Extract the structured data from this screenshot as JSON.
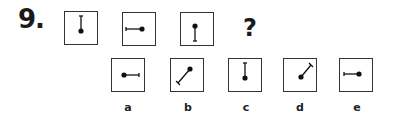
{
  "question": {
    "number": "9.",
    "mark": "?"
  },
  "sequence": [
    {
      "id": "seq-1",
      "direction": "up"
    },
    {
      "id": "seq-2",
      "direction": "left"
    },
    {
      "id": "seq-3",
      "direction": "down"
    }
  ],
  "options": [
    {
      "label": "a",
      "direction": "right"
    },
    {
      "label": "b",
      "direction": "down-left"
    },
    {
      "label": "c",
      "direction": "up"
    },
    {
      "label": "d",
      "direction": "up-right"
    },
    {
      "label": "e",
      "direction": "left"
    }
  ]
}
